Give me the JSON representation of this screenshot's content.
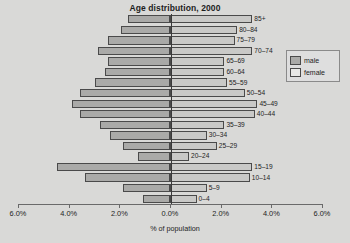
{
  "chart_data": {
    "type": "bar",
    "subtype": "population-pyramid",
    "title": "Age distribution, 2000",
    "xlabel": "% of population",
    "ylabel": "",
    "grid": false,
    "legend_position": "right",
    "xlim": [
      -6.0,
      6.0
    ],
    "xticks": [
      6.0,
      4.0,
      2.0,
      0.0,
      2.0,
      4.0,
      6.0
    ],
    "xtick_labels": [
      "6.0%",
      "4.0%",
      "2.0%",
      "0.0%",
      "2.0%",
      "4.0%",
      "6.0%"
    ],
    "categories": [
      "0-4",
      "5-9",
      "10-14",
      "15-19",
      "20-24",
      "25-29",
      "30-34",
      "35-39",
      "40-44",
      "45-49",
      "50-54",
      "55-59",
      "60-64",
      "65-69",
      "70-74",
      "75-79",
      "80-84",
      "85+"
    ],
    "series": [
      {
        "name": "male",
        "color": "#aaaaa8",
        "direction": "left",
        "values": [
          1.05,
          1.85,
          3.35,
          4.45,
          1.25,
          1.85,
          2.35,
          2.75,
          3.55,
          3.85,
          3.55,
          2.95,
          2.55,
          2.45,
          2.85,
          2.45,
          1.95,
          1.65
        ]
      },
      {
        "name": "female",
        "color": "#c9c9c7",
        "direction": "right",
        "values": [
          1.05,
          1.45,
          3.15,
          3.25,
          0.75,
          1.85,
          1.45,
          2.15,
          3.35,
          3.45,
          2.95,
          2.25,
          2.15,
          2.15,
          3.25,
          2.55,
          2.65,
          3.25
        ]
      }
    ]
  },
  "legend": {
    "items": [
      {
        "label": "male",
        "swatch": "male"
      },
      {
        "label": "female",
        "swatch": "female"
      }
    ]
  }
}
